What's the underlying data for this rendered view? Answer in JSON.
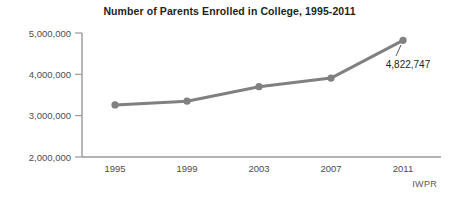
{
  "chart_data": {
    "type": "line",
    "title": "Number of Parents Enrolled in College, 1995-2011",
    "xlabel": "",
    "ylabel": "",
    "categories": [
      "1995",
      "1999",
      "2003",
      "2007",
      "2011"
    ],
    "values": [
      3260000,
      3350000,
      3700000,
      3910000,
      4822747
    ],
    "ytick_labels": [
      "5,000,000",
      "4,000,000",
      "3,000,000",
      "2,000,000"
    ],
    "ytick_values": [
      5000000,
      4000000,
      3000000,
      2000000
    ],
    "ylim": [
      2000000,
      5000000
    ],
    "grid": false,
    "legend": false,
    "annotations": [
      {
        "name": "last-point-value",
        "text": "4,822,747",
        "category": "2011",
        "value": 4822747
      }
    ],
    "source": "IWPR",
    "series_color": "#808080",
    "marker_color": "#808080",
    "axis_color": "#9a9a9a",
    "text_color": "#231f20",
    "background_color": "#ffffff"
  }
}
